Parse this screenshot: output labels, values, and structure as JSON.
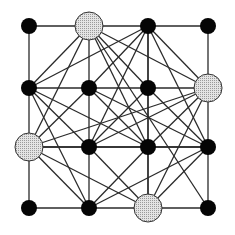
{
  "diagram": {
    "type": "graph",
    "grid": {
      "rows": 4,
      "cols": 4,
      "x": [
        29,
        89,
        148,
        208
      ],
      "y": [
        26,
        88,
        147,
        208
      ]
    },
    "colors": {
      "edge": "#2a2a2a",
      "node": "#050505",
      "queen_fill": "#d8d8d8",
      "queen_stroke": "#333333"
    },
    "node_radius": 8,
    "queen_radius": 14,
    "queens": [
      [
        0,
        1
      ],
      [
        1,
        3
      ],
      [
        2,
        0
      ],
      [
        3,
        2
      ]
    ],
    "edges": [
      [
        [
          0,
          0
        ],
        [
          0,
          1
        ]
      ],
      [
        [
          0,
          1
        ],
        [
          0,
          2
        ]
      ],
      [
        [
          0,
          2
        ],
        [
          0,
          3
        ]
      ],
      [
        [
          1,
          0
        ],
        [
          1,
          1
        ]
      ],
      [
        [
          1,
          1
        ],
        [
          1,
          2
        ]
      ],
      [
        [
          1,
          2
        ],
        [
          1,
          3
        ]
      ],
      [
        [
          2,
          0
        ],
        [
          2,
          1
        ]
      ],
      [
        [
          2,
          1
        ],
        [
          2,
          2
        ]
      ],
      [
        [
          2,
          2
        ],
        [
          2,
          3
        ]
      ],
      [
        [
          3,
          0
        ],
        [
          3,
          1
        ]
      ],
      [
        [
          3,
          1
        ],
        [
          3,
          2
        ]
      ],
      [
        [
          3,
          2
        ],
        [
          3,
          3
        ]
      ],
      [
        [
          0,
          0
        ],
        [
          1,
          0
        ]
      ],
      [
        [
          1,
          0
        ],
        [
          2,
          0
        ]
      ],
      [
        [
          2,
          0
        ],
        [
          3,
          0
        ]
      ],
      [
        [
          0,
          1
        ],
        [
          1,
          1
        ]
      ],
      [
        [
          1,
          1
        ],
        [
          2,
          1
        ]
      ],
      [
        [
          2,
          1
        ],
        [
          3,
          1
        ]
      ],
      [
        [
          0,
          2
        ],
        [
          1,
          2
        ]
      ],
      [
        [
          1,
          2
        ],
        [
          2,
          2
        ]
      ],
      [
        [
          2,
          2
        ],
        [
          3,
          2
        ]
      ],
      [
        [
          0,
          3
        ],
        [
          1,
          3
        ]
      ],
      [
        [
          1,
          3
        ],
        [
          2,
          3
        ]
      ],
      [
        [
          2,
          3
        ],
        [
          3,
          3
        ]
      ],
      [
        [
          0,
          1
        ],
        [
          1,
          0
        ]
      ],
      [
        [
          0,
          1
        ],
        [
          1,
          2
        ]
      ],
      [
        [
          0,
          1
        ],
        [
          2,
          0
        ]
      ],
      [
        [
          0,
          1
        ],
        [
          2,
          2
        ]
      ],
      [
        [
          0,
          1
        ],
        [
          1,
          3
        ]
      ],
      [
        [
          0,
          1
        ],
        [
          3,
          3
        ]
      ],
      [
        [
          0,
          2
        ],
        [
          1,
          0
        ]
      ],
      [
        [
          0,
          2
        ],
        [
          1,
          1
        ]
      ],
      [
        [
          0,
          2
        ],
        [
          1,
          3
        ]
      ],
      [
        [
          0,
          2
        ],
        [
          2,
          1
        ]
      ],
      [
        [
          0,
          2
        ],
        [
          2,
          3
        ]
      ],
      [
        [
          0,
          2
        ],
        [
          3,
          2
        ]
      ],
      [
        [
          1,
          0
        ],
        [
          2,
          1
        ]
      ],
      [
        [
          1,
          0
        ],
        [
          3,
          1
        ]
      ],
      [
        [
          1,
          0
        ],
        [
          2,
          2
        ]
      ],
      [
        [
          1,
          1
        ],
        [
          2,
          0
        ]
      ],
      [
        [
          1,
          1
        ],
        [
          2,
          2
        ]
      ],
      [
        [
          1,
          2
        ],
        [
          2,
          1
        ]
      ],
      [
        [
          1,
          2
        ],
        [
          2,
          3
        ]
      ],
      [
        [
          1,
          3
        ],
        [
          2,
          2
        ]
      ],
      [
        [
          1,
          3
        ],
        [
          3,
          2
        ]
      ],
      [
        [
          1,
          3
        ],
        [
          2,
          1
        ]
      ],
      [
        [
          2,
          0
        ],
        [
          3,
          1
        ]
      ],
      [
        [
          2,
          0
        ],
        [
          3,
          2
        ]
      ],
      [
        [
          2,
          0
        ],
        [
          2,
          3
        ]
      ],
      [
        [
          2,
          0
        ],
        [
          1,
          3
        ]
      ],
      [
        [
          2,
          1
        ],
        [
          3,
          2
        ]
      ],
      [
        [
          2,
          2
        ],
        [
          3,
          1
        ]
      ],
      [
        [
          2,
          3
        ],
        [
          3,
          2
        ]
      ],
      [
        [
          2,
          3
        ],
        [
          3,
          1
        ]
      ],
      [
        [
          2,
          3
        ],
        [
          1,
          1
        ]
      ]
    ]
  }
}
